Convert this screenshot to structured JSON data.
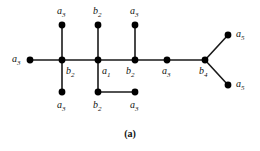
{
  "figure": {
    "caption": "(a)",
    "background_color": "#ffffff",
    "edge_color": "#1a1a1a",
    "node_color": "#000000",
    "label_color": "#111111",
    "width": 260,
    "height": 151
  },
  "graph_data": {
    "type": "diagram",
    "description": "Labeled tree graph with weighted vertex labels",
    "nodes": [
      {
        "id": "n1",
        "label": "a",
        "sub": "3",
        "x": 30,
        "y": 60,
        "label_x": 12,
        "label_y": 54
      },
      {
        "id": "n2",
        "label": "b",
        "sub": "2",
        "x": 62,
        "y": 60,
        "label_x": 66,
        "label_y": 66
      },
      {
        "id": "n3",
        "label": "a",
        "sub": "1",
        "x": 98,
        "y": 60,
        "label_x": 102,
        "label_y": 66
      },
      {
        "id": "n4",
        "label": "b",
        "sub": "2",
        "x": 135,
        "y": 60,
        "label_x": 126,
        "label_y": 66
      },
      {
        "id": "n5",
        "label": "a",
        "sub": "3",
        "x": 167,
        "y": 60,
        "label_x": 162,
        "label_y": 66
      },
      {
        "id": "n6",
        "label": "b",
        "sub": "4",
        "x": 205,
        "y": 60,
        "label_x": 199,
        "label_y": 66
      },
      {
        "id": "n7",
        "label": "a",
        "sub": "3",
        "x": 62,
        "y": 25,
        "label_x": 57,
        "label_y": 6
      },
      {
        "id": "n8",
        "label": "b",
        "sub": "2",
        "x": 98,
        "y": 25,
        "label_x": 93,
        "label_y": 6
      },
      {
        "id": "n9",
        "label": "a",
        "sub": "3",
        "x": 135,
        "y": 25,
        "label_x": 130,
        "label_y": 6
      },
      {
        "id": "n10",
        "label": "a",
        "sub": "3",
        "x": 62,
        "y": 92,
        "label_x": 57,
        "label_y": 100
      },
      {
        "id": "n11",
        "label": "b",
        "sub": "2",
        "x": 98,
        "y": 92,
        "label_x": 93,
        "label_y": 100
      },
      {
        "id": "n12",
        "label": "a",
        "sub": "3",
        "x": 135,
        "y": 92,
        "label_x": 130,
        "label_y": 100
      },
      {
        "id": "n13",
        "label": "a",
        "sub": "5",
        "x": 228,
        "y": 35,
        "label_x": 236,
        "label_y": 29
      },
      {
        "id": "n14",
        "label": "a",
        "sub": "5",
        "x": 228,
        "y": 85,
        "label_x": 236,
        "label_y": 79
      }
    ],
    "edges": [
      {
        "from": "n1",
        "to": "n2"
      },
      {
        "from": "n2",
        "to": "n3"
      },
      {
        "from": "n3",
        "to": "n4"
      },
      {
        "from": "n4",
        "to": "n5"
      },
      {
        "from": "n5",
        "to": "n6"
      },
      {
        "from": "n2",
        "to": "n7"
      },
      {
        "from": "n3",
        "to": "n8"
      },
      {
        "from": "n4",
        "to": "n9"
      },
      {
        "from": "n2",
        "to": "n10"
      },
      {
        "from": "n3",
        "to": "n11"
      },
      {
        "from": "n11",
        "to": "n12"
      },
      {
        "from": "n6",
        "to": "n13"
      },
      {
        "from": "n6",
        "to": "n14"
      }
    ]
  }
}
